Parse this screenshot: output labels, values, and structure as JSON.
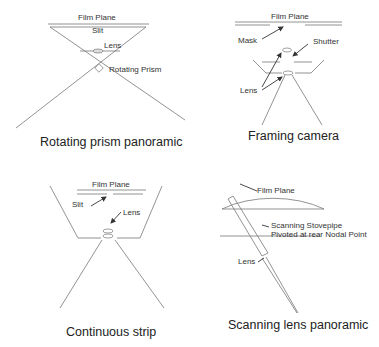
{
  "panels": [
    {
      "id": "rotating-prism",
      "caption": "Rotating prism panoramic",
      "labels": {
        "film_plane": "Film Plane",
        "slit": "Slit",
        "lens": "Lens",
        "prism": "Rotating Prism"
      }
    },
    {
      "id": "framing-camera",
      "caption": "Framing camera",
      "labels": {
        "film_plane": "Film Plane",
        "mask": "Mask",
        "shutter": "Shutter",
        "lens": "Lens"
      }
    },
    {
      "id": "continuous-strip",
      "caption": "Continuous strip",
      "labels": {
        "film_plane": "Film Plane",
        "slit": "Slit",
        "lens": "Lens"
      }
    },
    {
      "id": "scanning-lens",
      "caption": "Scanning lens panoramic",
      "labels": {
        "film_plane": "Film Plane",
        "stovepipe_1": "Scanning Stovepipe",
        "stovepipe_2": "Pivoted at rear Nodal Point",
        "lens": "Lens"
      }
    }
  ]
}
